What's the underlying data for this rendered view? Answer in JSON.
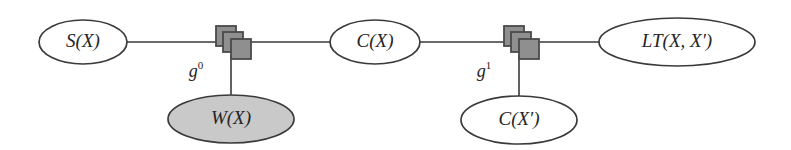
{
  "figure": {
    "kind": "factor-graph",
    "background_color": "#ffffff",
    "stroke_color": "#3a3a3a",
    "text_color": "#242424",
    "shaded_fill": "#c9c9c9",
    "factor_square_fill": "#8f8f8f",
    "factor_square_stroke": "#4a4a4a"
  },
  "variable_nodes": [
    {
      "id": "s-of-x",
      "label": "S(X)",
      "shaded": false,
      "cx": 83,
      "cy": 42,
      "rx": 44,
      "ry": 22,
      "font_size": 19
    },
    {
      "id": "c-of-x",
      "label": "C(X)",
      "shaded": false,
      "cx": 375,
      "cy": 42,
      "rx": 45,
      "ry": 22,
      "font_size": 19
    },
    {
      "id": "lt-of-x-xprime",
      "label": "LT(X, X′)",
      "shaded": false,
      "cx": 677,
      "cy": 42,
      "rx": 78,
      "ry": 24,
      "font_size": 19
    },
    {
      "id": "w-of-x",
      "label": "W(X)",
      "shaded": true,
      "cx": 231,
      "cy": 119,
      "rx": 63,
      "ry": 24,
      "font_size": 19
    },
    {
      "id": "c-of-xprime",
      "label": "C(X′)",
      "shaded": false,
      "cx": 519,
      "cy": 120,
      "rx": 58,
      "ry": 24,
      "font_size": 19
    }
  ],
  "factor_nodes": [
    {
      "id": "g0",
      "label": "g",
      "superscript": "0",
      "x": 228,
      "y": 42,
      "label_x": 196,
      "label_y": 73,
      "font_size": 18,
      "sup_font_size": 11
    },
    {
      "id": "g1",
      "label": "g",
      "superscript": "1",
      "x": 516,
      "y": 42,
      "label_x": 484,
      "label_y": 73,
      "font_size": 18,
      "sup_font_size": 11
    }
  ],
  "edges": [
    {
      "id": "edge-s-to-g0",
      "x1": 127,
      "y1": 42,
      "x2": 224,
      "y2": 42
    },
    {
      "id": "edge-g0-to-c",
      "x1": 234,
      "y1": 42,
      "x2": 330,
      "y2": 42
    },
    {
      "id": "edge-c-to-g1",
      "x1": 420,
      "y1": 42,
      "x2": 512,
      "y2": 42
    },
    {
      "id": "edge-g1-to-lt",
      "x1": 522,
      "y1": 42,
      "x2": 599,
      "y2": 42
    },
    {
      "id": "edge-g0-to-w",
      "x1": 231,
      "y1": 56,
      "x2": 231,
      "y2": 96
    },
    {
      "id": "edge-g1-to-cxprime",
      "x1": 519,
      "y1": 56,
      "x2": 519,
      "y2": 97
    }
  ],
  "factor_square": {
    "size": 20,
    "offsets": [
      {
        "dx": -12,
        "dy": -16
      },
      {
        "dx": -5,
        "dy": -10
      },
      {
        "dx": 3,
        "dy": -3
      }
    ]
  }
}
